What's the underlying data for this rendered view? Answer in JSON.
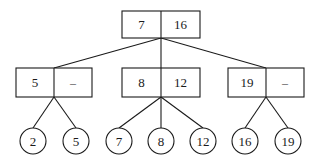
{
  "diagram": {
    "title": "",
    "type": "2-3 tree",
    "root": {
      "keys": [
        "7",
        "16"
      ],
      "box": {
        "x": 122,
        "y": 11,
        "w": 78,
        "h": 27
      }
    },
    "internal_nodes": [
      {
        "id": "left",
        "keys": [
          "5",
          "–"
        ],
        "box": {
          "x": 16,
          "y": 68,
          "w": 76,
          "h": 29
        }
      },
      {
        "id": "middle",
        "keys": [
          "8",
          "12"
        ],
        "box": {
          "x": 122,
          "y": 68,
          "w": 78,
          "h": 29
        }
      },
      {
        "id": "right",
        "keys": [
          "19",
          "–"
        ],
        "box": {
          "x": 228,
          "y": 68,
          "w": 76,
          "h": 29
        }
      }
    ],
    "leaves": [
      {
        "value": "2",
        "parent": "left",
        "cx": 33,
        "cy": 141,
        "r": 13
      },
      {
        "value": "5",
        "parent": "left",
        "cx": 76,
        "cy": 141,
        "r": 13
      },
      {
        "value": "7",
        "parent": "middle",
        "cx": 119,
        "cy": 141,
        "r": 13
      },
      {
        "value": "8",
        "parent": "middle",
        "cx": 161,
        "cy": 141,
        "r": 13
      },
      {
        "value": "12",
        "parent": "middle",
        "cx": 203,
        "cy": 141,
        "r": 13
      },
      {
        "value": "16",
        "parent": "right",
        "cx": 245,
        "cy": 141,
        "r": 13
      },
      {
        "value": "19",
        "parent": "right",
        "cx": 288,
        "cy": 141,
        "r": 13
      }
    ],
    "colors": {
      "stroke": "#1a1a1a",
      "background": "#ffffff"
    }
  }
}
